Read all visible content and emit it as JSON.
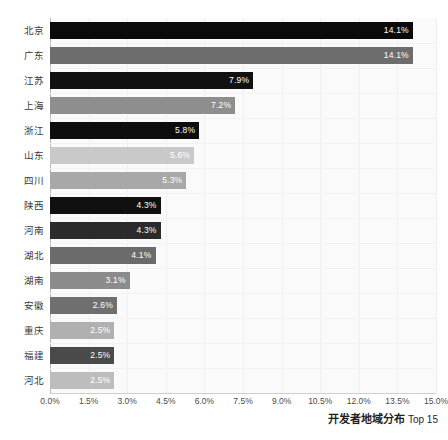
{
  "chart_data": {
    "type": "bar",
    "orientation": "horizontal",
    "title": "开发者地域分布 Top 15",
    "title_cn": "开发者地域分布",
    "title_en": "Top 15",
    "xlabel": "",
    "ylabel": "",
    "xlim": [
      0,
      15
    ],
    "xtick_labels": [
      "0.0%",
      "1.5%",
      "3.0%",
      "4.5%",
      "6.0%",
      "7.5%",
      "9.0%",
      "10.5%",
      "12.0%",
      "13.5%",
      "15.0%"
    ],
    "xtick_values": [
      0,
      1.5,
      3.0,
      4.5,
      6.0,
      7.5,
      9.0,
      10.5,
      12.0,
      13.5,
      15.0
    ],
    "grid": true,
    "legend": "none",
    "unit": "%",
    "categories": [
      "北京",
      "广东",
      "江苏",
      "上海",
      "浙江",
      "山东",
      "四川",
      "陕西",
      "河南",
      "湖北",
      "湖南",
      "安徽",
      "重庆",
      "福建",
      "河北"
    ],
    "values": [
      14.1,
      14.1,
      7.9,
      7.2,
      5.8,
      5.6,
      5.3,
      4.3,
      4.3,
      4.1,
      3.1,
      2.6,
      2.5,
      2.5,
      2.5
    ],
    "value_labels": [
      "14.1%",
      "14.1%",
      "7.9%",
      "7.2%",
      "5.8%",
      "5.6%",
      "5.3%",
      "4.3%",
      "4.3%",
      "4.1%",
      "3.1%",
      "2.6%",
      "2.5%",
      "2.5%",
      "2.5%"
    ],
    "bar_colors": [
      "#0a0a0a",
      "#6d6d6d",
      "#111111",
      "#8e8e8e",
      "#0d0d0d",
      "#c9c9c9",
      "#a8a8a8",
      "#101010",
      "#2b2b2b",
      "#6b6b6b",
      "#8b8b8b",
      "#6f6f6f",
      "#b0b0b0",
      "#4a4a4a",
      "#bdbdbd"
    ],
    "value_label_color": "#ffffff",
    "plot_background": "#fafafa",
    "gridline_color": "#f0f0f0",
    "axis_color": "#b9b9b9"
  }
}
